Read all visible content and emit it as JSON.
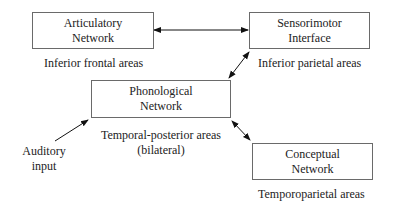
{
  "nodes": {
    "articulatory": {
      "line1": "Articulatory",
      "line2": "Network",
      "caption": "Inferior frontal areas"
    },
    "sensorimotor": {
      "line1": "Sensorimotor",
      "line2": "Interface",
      "caption": "Inferior parietal areas"
    },
    "phonological": {
      "line1": "Phonological",
      "line2": "Network",
      "caption1": "Temporal-posterior areas",
      "caption2": "(bilateral)"
    },
    "conceptual": {
      "line1": "Conceptual",
      "line2": "Network",
      "caption": "Temporoparietal areas"
    }
  },
  "input": {
    "line1": "Auditory",
    "line2": "input"
  },
  "edges": [
    {
      "from": "articulatory",
      "to": "sensorimotor",
      "type": "bidirectional"
    },
    {
      "from": "phonological",
      "to": "sensorimotor",
      "type": "bidirectional"
    },
    {
      "from": "phonological",
      "to": "conceptual",
      "type": "bidirectional"
    },
    {
      "from": "auditory-input",
      "to": "phonological",
      "type": "directed"
    }
  ]
}
